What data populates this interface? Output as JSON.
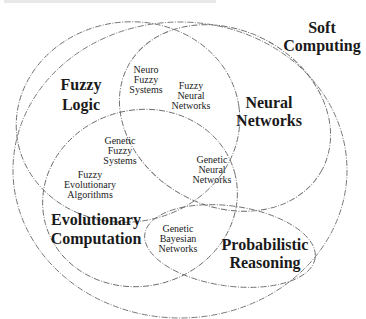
{
  "diagram": {
    "type": "venn",
    "top_cutoff_text": "",
    "outer_set": {
      "label_line1": "Soft",
      "label_line2": "Computing"
    },
    "sets": [
      {
        "id": "fuzzy_logic",
        "line1": "Fuzzy",
        "line2": "Logic"
      },
      {
        "id": "neural_networks",
        "line1": "Neural",
        "line2": "Networks"
      },
      {
        "id": "evolutionary_computation",
        "line1": "Evolutionary",
        "line2": "Computation"
      },
      {
        "id": "probabilistic_reasoning",
        "line1": "Probabilistic",
        "line2": "Reasoning"
      }
    ],
    "intersections": [
      {
        "id": "neuro_fuzzy_systems",
        "lines": [
          "Neuro",
          "Fuzzy",
          "Systems"
        ]
      },
      {
        "id": "fuzzy_neural_networks",
        "lines": [
          "Fuzzy",
          "Neural",
          "Networks"
        ]
      },
      {
        "id": "genetic_fuzzy_systems",
        "lines": [
          "Genetic",
          "Fuzzy",
          "Systems"
        ]
      },
      {
        "id": "fuzzy_evolutionary_algorithms",
        "lines": [
          "Fuzzy",
          "Evolutionary",
          "Algorithms"
        ]
      },
      {
        "id": "genetic_neural_networks",
        "lines": [
          "Genetic",
          "Neural",
          "Networks"
        ]
      },
      {
        "id": "genetic_bayesian_networks",
        "lines": [
          "Genetic",
          "Bayesian",
          "Networks"
        ]
      }
    ],
    "colors": {
      "stroke": "#6a6a6a",
      "text": "#1a1a1a",
      "background": "#ffffff"
    }
  }
}
